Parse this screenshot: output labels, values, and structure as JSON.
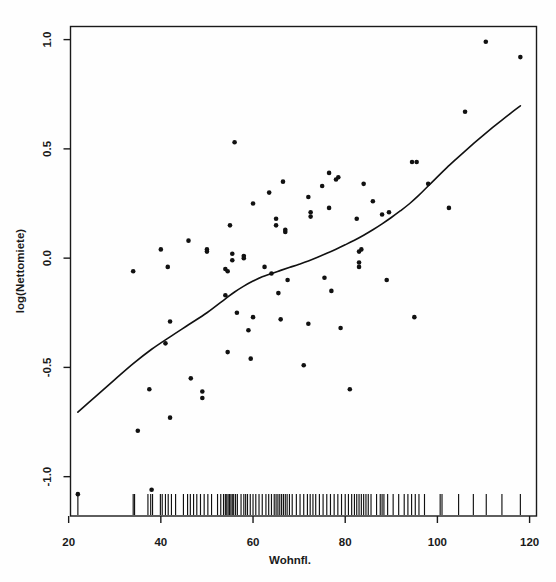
{
  "chart_data": {
    "type": "scatter",
    "title": "",
    "xlabel": "Wohnfl.",
    "ylabel": "log(Nettomiete)",
    "xlim": [
      20.4,
      121.5
    ],
    "ylim": [
      -1.18,
      1.06
    ],
    "xticks": [
      20,
      40,
      60,
      80,
      100,
      120
    ],
    "xtick_labels": [
      "20",
      "40",
      "60",
      "80",
      "100",
      "120"
    ],
    "yticks": [
      -1.0,
      -0.5,
      0.0,
      0.5,
      1.0
    ],
    "ytick_labels": [
      "-1.0",
      "-0.5",
      "0.0",
      "0.5",
      "1.0"
    ],
    "grid": false,
    "legend": null,
    "point_color": "#111111",
    "curve_color": "#111111",
    "axis_color": "#1a1a1a",
    "background_color": "#fefefe",
    "box_frame": true,
    "rug_axis": "x",
    "series": [
      {
        "name": "observations",
        "marker": "filled-circle",
        "points": [
          [
            22.0,
            -1.08
          ],
          [
            34.0,
            -0.06
          ],
          [
            35.0,
            -0.79
          ],
          [
            37.5,
            -0.6
          ],
          [
            38.0,
            -1.06
          ],
          [
            40.0,
            0.04
          ],
          [
            41.0,
            -0.39
          ],
          [
            41.5,
            -0.04
          ],
          [
            42.0,
            -0.29
          ],
          [
            42.0,
            -0.73
          ],
          [
            46.0,
            0.08
          ],
          [
            46.5,
            -0.55
          ],
          [
            49.0,
            -0.61
          ],
          [
            49.0,
            -0.64
          ],
          [
            50.0,
            0.04
          ],
          [
            50.0,
            0.03
          ],
          [
            54.0,
            -0.17
          ],
          [
            54.0,
            -0.05
          ],
          [
            54.5,
            -0.06
          ],
          [
            54.5,
            -0.43
          ],
          [
            55.0,
            0.15
          ],
          [
            55.5,
            0.02
          ],
          [
            55.5,
            -0.01
          ],
          [
            56.0,
            0.53
          ],
          [
            56.5,
            -0.25
          ],
          [
            58.0,
            0.0
          ],
          [
            58.0,
            0.01
          ],
          [
            59.0,
            -0.33
          ],
          [
            59.5,
            -0.46
          ],
          [
            60.0,
            0.25
          ],
          [
            60.0,
            -0.27
          ],
          [
            62.5,
            -0.04
          ],
          [
            63.5,
            0.3
          ],
          [
            64.0,
            -0.07
          ],
          [
            65.0,
            0.18
          ],
          [
            65.0,
            0.15
          ],
          [
            65.5,
            -0.16
          ],
          [
            66.0,
            -0.28
          ],
          [
            66.5,
            0.35
          ],
          [
            67.0,
            0.12
          ],
          [
            67.0,
            0.13
          ],
          [
            67.5,
            -0.1
          ],
          [
            71.0,
            -0.49
          ],
          [
            72.0,
            -0.3
          ],
          [
            72.0,
            0.28
          ],
          [
            72.5,
            0.21
          ],
          [
            72.5,
            0.19
          ],
          [
            75.0,
            0.33
          ],
          [
            75.5,
            -0.09
          ],
          [
            76.5,
            0.39
          ],
          [
            76.5,
            0.23
          ],
          [
            77.0,
            -0.15
          ],
          [
            78.0,
            0.36
          ],
          [
            78.5,
            0.37
          ],
          [
            79.0,
            -0.32
          ],
          [
            81.0,
            -0.6
          ],
          [
            82.5,
            0.18
          ],
          [
            83.0,
            0.03
          ],
          [
            83.5,
            0.04
          ],
          [
            83.0,
            -0.02
          ],
          [
            83.0,
            -0.04
          ],
          [
            84.0,
            0.34
          ],
          [
            86.0,
            0.26
          ],
          [
            88.0,
            0.2
          ],
          [
            89.0,
            -0.1
          ],
          [
            89.5,
            0.21
          ],
          [
            94.5,
            0.44
          ],
          [
            95.5,
            0.44
          ],
          [
            95.0,
            -0.27
          ],
          [
            98.0,
            0.34
          ],
          [
            102.5,
            0.23
          ],
          [
            106.0,
            0.67
          ],
          [
            110.5,
            0.99
          ],
          [
            118.0,
            0.92
          ]
        ]
      }
    ],
    "fit_curve": {
      "name": "smooth-fit",
      "points": [
        [
          22.0,
          -0.705
        ],
        [
          26.0,
          -0.63
        ],
        [
          30.0,
          -0.556
        ],
        [
          34.0,
          -0.483
        ],
        [
          38.0,
          -0.417
        ],
        [
          42.0,
          -0.36
        ],
        [
          46.0,
          -0.305
        ],
        [
          50.0,
          -0.25
        ],
        [
          54.0,
          -0.186
        ],
        [
          56.0,
          -0.155
        ],
        [
          58.0,
          -0.128
        ],
        [
          60.0,
          -0.105
        ],
        [
          62.0,
          -0.085
        ],
        [
          64.0,
          -0.07
        ],
        [
          66.0,
          -0.056
        ],
        [
          68.0,
          -0.042
        ],
        [
          70.0,
          -0.028
        ],
        [
          72.0,
          -0.013
        ],
        [
          74.0,
          0.004
        ],
        [
          76.0,
          0.022
        ],
        [
          78.0,
          0.041
        ],
        [
          80.0,
          0.061
        ],
        [
          82.0,
          0.082
        ],
        [
          84.0,
          0.105
        ],
        [
          86.0,
          0.13
        ],
        [
          88.0,
          0.157
        ],
        [
          90.0,
          0.186
        ],
        [
          92.0,
          0.217
        ],
        [
          94.0,
          0.25
        ],
        [
          96.0,
          0.288
        ],
        [
          98.0,
          0.33
        ],
        [
          100.0,
          0.372
        ],
        [
          102.0,
          0.413
        ],
        [
          104.0,
          0.452
        ],
        [
          106.0,
          0.49
        ],
        [
          108.0,
          0.527
        ],
        [
          110.0,
          0.563
        ],
        [
          112.0,
          0.598
        ],
        [
          114.0,
          0.632
        ],
        [
          116.0,
          0.665
        ],
        [
          118.0,
          0.697
        ]
      ]
    },
    "rug_values": [
      22.0,
      34.0,
      34.3,
      37.2,
      37.8,
      38.2,
      39.9,
      40.3,
      41.0,
      41.6,
      42.3,
      43.2,
      44.9,
      45.8,
      46.4,
      47.1,
      47.8,
      48.6,
      49.4,
      50.2,
      51.0,
      52.3,
      53.0,
      53.6,
      54.0,
      54.3,
      54.6,
      54.9,
      55.2,
      55.5,
      55.8,
      56.2,
      56.6,
      57.4,
      58.0,
      58.4,
      58.8,
      59.4,
      60.0,
      60.6,
      61.3,
      62.0,
      62.8,
      63.4,
      64.0,
      64.6,
      65.0,
      65.4,
      65.8,
      66.2,
      66.6,
      67.0,
      67.4,
      67.9,
      68.5,
      69.4,
      70.2,
      71.0,
      71.8,
      72.4,
      73.0,
      73.6,
      74.4,
      75.2,
      76.0,
      76.8,
      77.6,
      78.4,
      79.2,
      80.0,
      80.7,
      81.4,
      82.0,
      82.5,
      83.0,
      83.5,
      84.0,
      84.5,
      85.0,
      85.6,
      86.8,
      87.6,
      88.0,
      88.4,
      89.2,
      90.4,
      91.6,
      92.8,
      93.6,
      94.4,
      95.2,
      96.0,
      97.2,
      100.6,
      101.0,
      104.6,
      107.8,
      110.6,
      114.0,
      118.0
    ]
  },
  "axes": {
    "x_title": "Wohnfl.",
    "y_title": "log(Nettomiete)"
  }
}
